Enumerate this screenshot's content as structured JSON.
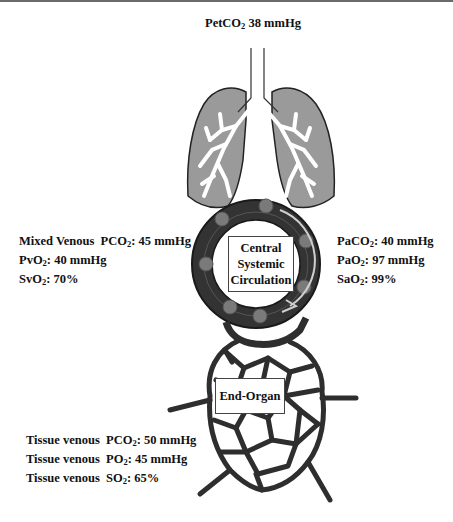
{
  "figure": {
    "top_label": {
      "prefix": "PetCO",
      "sub": "2",
      "suffix": " 38 mmHg"
    },
    "central_box": {
      "lines": [
        "Central",
        "Systemic",
        "Circulation"
      ]
    },
    "end_organ_box": {
      "label": "End-Organ"
    },
    "mixed_venous": [
      {
        "prefix": "Mixed Venous  PCO",
        "sub": "2",
        "suffix": ": 45 mmHg"
      },
      {
        "prefix": "PvO",
        "sub": "2",
        "suffix": ": 40 mmHg"
      },
      {
        "prefix": "SvO",
        "sub": "2",
        "suffix": ": 70%"
      }
    ],
    "arterial": [
      {
        "prefix": "PaCO",
        "sub": "2",
        "suffix": ": 40 mmHg"
      },
      {
        "prefix": "PaO",
        "sub": "2",
        "suffix": ": 97 mmHg"
      },
      {
        "prefix": "SaO",
        "sub": "2",
        "suffix": ": 99%"
      }
    ],
    "tissue_venous": [
      {
        "prefix": "Tissue venous  PCO",
        "sub": "2",
        "suffix": ": 50 mmHg"
      },
      {
        "prefix": "Tissue venous  PO",
        "sub": "2",
        "suffix": ": 45 mmHg"
      },
      {
        "prefix": "Tissue venous  SO",
        "sub": "2",
        "suffix": ": 65%"
      }
    ],
    "colors": {
      "lung_fill": "#9a9a9a",
      "vessel_dark": "#2e2e2e",
      "blood_cell": "#7a7a7a",
      "airway": "#ffffff"
    }
  }
}
